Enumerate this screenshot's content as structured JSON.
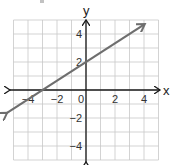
{
  "unidentified_fragment": {
    "note": "small partial mark at top-left; glyph could not be identified from the pixels"
  },
  "chart_data": {
    "type": "line",
    "title": "",
    "xlabel": "x",
    "ylabel": "y",
    "xlim": [
      -5,
      5
    ],
    "ylim": [
      -5,
      5
    ],
    "grid": true,
    "x_ticks": [
      -4,
      -2,
      0,
      2,
      4
    ],
    "y_ticks": [
      4,
      2,
      -2,
      -4
    ],
    "x_tick_labels": [
      "−4",
      "−2",
      "0",
      "2",
      "4"
    ],
    "y_tick_labels": [
      "4",
      "2",
      "−2",
      "−4"
    ],
    "series": [
      {
        "name": "line",
        "equation": "y = (2/3)x + 2",
        "slope": 0.6667,
        "y_intercept": 2,
        "x_intercept": -3,
        "endpoints": [
          [
            -5.5,
            -1.67
          ],
          [
            4,
            4.67
          ]
        ],
        "arrows_both_ends": true,
        "color": "#6e6e6e"
      }
    ],
    "axes_arrows": true
  },
  "colors": {
    "grid": "#c8c8c8",
    "axes": "#1a1a1a",
    "line": "#6e6e6e",
    "background": "#ffffff"
  }
}
